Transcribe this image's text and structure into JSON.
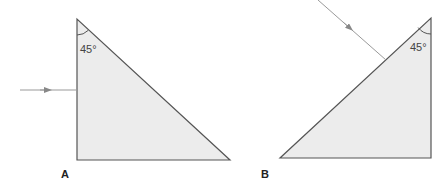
{
  "diagram": {
    "colors": {
      "fill": "#ececec",
      "outline": "#555555",
      "ray": "#999999",
      "text": "#222222"
    },
    "prism_a": {
      "label": "A",
      "angle_label": "45°",
      "vertices": [
        [
          77,
          19
        ],
        [
          77,
          160
        ],
        [
          230,
          160
        ]
      ],
      "ray": {
        "from": [
          20,
          90
        ],
        "to": [
          77,
          90
        ],
        "arrow_at": [
          46,
          90
        ],
        "direction": "right"
      }
    },
    "prism_b": {
      "label": "B",
      "angle_label": "45°",
      "vertices": [
        [
          431,
          18
        ],
        [
          431,
          158
        ],
        [
          280,
          158
        ]
      ],
      "ray": {
        "from": [
          318,
          0
        ],
        "to": [
          386,
          60
        ],
        "arrow_at": [
          348,
          26
        ],
        "direction": "down-right"
      }
    }
  }
}
